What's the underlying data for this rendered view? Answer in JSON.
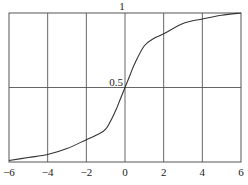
{
  "chart_data": {
    "type": "line",
    "title": "",
    "xlabel": "",
    "ylabel": "",
    "xlim": [
      -6,
      6
    ],
    "ylim": [
      0,
      1
    ],
    "grid": true,
    "legend": null,
    "x_ticks": [
      -6,
      -4,
      -2,
      0,
      2,
      4,
      6
    ],
    "x_tick_labels": [
      "−6",
      "−4",
      "−2",
      "0",
      "2",
      "4",
      "6"
    ],
    "y_tick_labels": [
      {
        "value": 1,
        "label": "1"
      },
      {
        "value": 0.5,
        "label": "0.5"
      }
    ],
    "series": [
      {
        "name": "curve",
        "color": "#333333",
        "x": [
          -6,
          -5,
          -4,
          -3,
          -2,
          -1.5,
          -1,
          -0.5,
          -0.25,
          0,
          0.25,
          0.5,
          1,
          1.5,
          2,
          3,
          4,
          5,
          6
        ],
        "y": [
          0.01,
          0.03,
          0.05,
          0.09,
          0.15,
          0.18,
          0.22,
          0.34,
          0.42,
          0.5,
          0.58,
          0.66,
          0.78,
          0.83,
          0.86,
          0.93,
          0.96,
          0.985,
          1.0
        ]
      }
    ]
  },
  "colors": {
    "axis": "#555555",
    "grid": "#555555",
    "curve": "#333333",
    "background": "#ffffff"
  }
}
